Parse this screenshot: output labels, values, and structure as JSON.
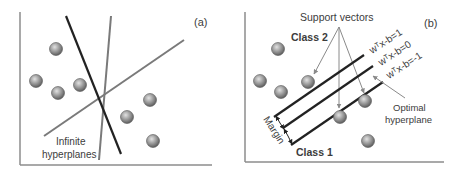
{
  "panel_a": {
    "tag": "(a)",
    "label_line1": "Infinite",
    "label_line2": "hyperplanes",
    "points": [
      [
        56,
        49
      ],
      [
        36,
        81
      ],
      [
        58,
        93
      ],
      [
        80,
        85
      ],
      [
        150,
        100
      ],
      [
        127,
        117
      ],
      [
        153,
        141
      ]
    ]
  },
  "panel_b": {
    "tag": "(b)",
    "support_vectors_label": "Support vectors",
    "class2_label": "Class 2",
    "class1_label": "Class 1",
    "margin_label": "Margin",
    "optimal_line1": "Optimal",
    "optimal_line2": "hyperplane",
    "eq_plus": "wᵀx-b=1",
    "eq_zero": "wᵀx-b=0",
    "eq_minus": "wᵀx-b=-1",
    "points": [
      [
        278,
        49
      ],
      [
        260,
        81
      ],
      [
        281,
        92
      ],
      [
        308,
        82
      ],
      [
        365,
        101
      ],
      [
        340,
        117
      ],
      [
        368,
        141
      ]
    ]
  },
  "colors": {
    "axis": "#8c8c8c",
    "dark_line": "#222222",
    "gray_line": "#7a7a7a",
    "point_light": "#d8d8d8",
    "point_dark": "#6a6a6a",
    "arrow": "#8a8a8a"
  }
}
